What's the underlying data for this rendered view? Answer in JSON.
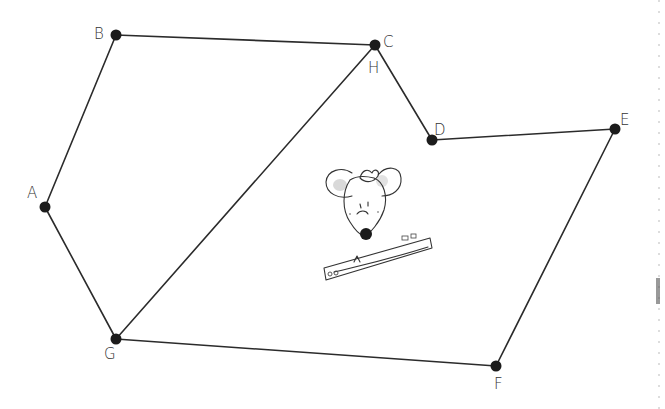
{
  "figure": {
    "vertices": [
      {
        "id": "A",
        "label": "A"
      },
      {
        "id": "B",
        "label": "B"
      },
      {
        "id": "C",
        "label": "C"
      },
      {
        "id": "H",
        "label": "H"
      },
      {
        "id": "D",
        "label": "D"
      },
      {
        "id": "E",
        "label": "E"
      },
      {
        "id": "F",
        "label": "F"
      },
      {
        "id": "G",
        "label": "G"
      }
    ],
    "edges": [
      [
        "A",
        "B"
      ],
      [
        "B",
        "C"
      ],
      [
        "C",
        "D"
      ],
      [
        "D",
        "E"
      ],
      [
        "E",
        "F"
      ],
      [
        "F",
        "G"
      ],
      [
        "G",
        "A"
      ],
      [
        "G",
        "H"
      ]
    ],
    "notes": {
      "coincident_points": "C and H share the same dot",
      "illustration": "mouse-with-ruler"
    },
    "colors": {
      "line": "#2b2b2b",
      "dot": "#1c1c1c",
      "label": "#333333",
      "background": "#ffffff"
    }
  }
}
